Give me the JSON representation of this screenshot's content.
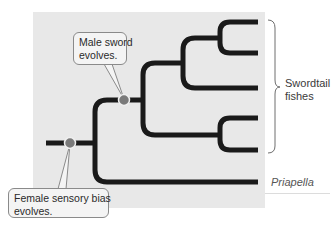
{
  "diagram": {
    "type": "phylogenetic-tree",
    "colors": {
      "panel_background": "#e8e8e8",
      "branch": "#1a1a1a",
      "node_fill": "#7a7a7a",
      "node_ring": "#f0f0f0",
      "callout_border": "#8a8a8a",
      "callout_background": "#f4f4f4",
      "bracket": "#6e6e6e"
    },
    "callouts": {
      "male": {
        "line1": "Male sword",
        "line2": "evolves."
      },
      "female": {
        "line1": "Female sensory bias",
        "line2": "evolves."
      }
    },
    "groups": {
      "swordtail": {
        "line1": "Swordtail",
        "line2": "fishes",
        "leaf_count": 5
      }
    },
    "taxa": {
      "outgroup": "Priapella"
    },
    "nodes": [
      {
        "id": "female-sensory-bias",
        "event": "Female sensory bias evolves."
      },
      {
        "id": "male-sword",
        "event": "Male sword evolves."
      }
    ]
  }
}
